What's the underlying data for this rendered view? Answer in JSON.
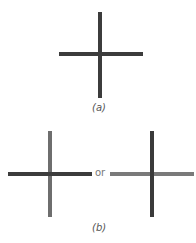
{
  "figure": {
    "panel_a": {
      "caption": "(a)",
      "horizontal_color": "#3c3c3c",
      "vertical_color": "#3c3c3c"
    },
    "panel_b": {
      "caption": "(b)",
      "connector": "or",
      "left_cross": {
        "horizontal_color": "#3c3c3c",
        "vertical_color": "#6e6e6e"
      },
      "right_cross": {
        "horizontal_color": "#7a7a7a",
        "vertical_color": "#3a3a3a"
      }
    }
  }
}
